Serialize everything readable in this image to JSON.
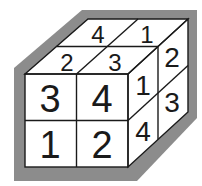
{
  "diagram": {
    "type": "2x2x2-cube-isometric",
    "colors": {
      "border": "#8c8c8c",
      "face": "#ffffff",
      "line": "#1a1a1a"
    },
    "faces": {
      "front": {
        "cells": [
          {
            "pos": "top-left",
            "value": "3"
          },
          {
            "pos": "top-right",
            "value": "4"
          },
          {
            "pos": "bottom-left",
            "value": "1"
          },
          {
            "pos": "bottom-right",
            "value": "2"
          }
        ]
      },
      "top": {
        "cells": [
          {
            "pos": "back-left",
            "value": "4"
          },
          {
            "pos": "back-right",
            "value": "1"
          },
          {
            "pos": "front-left",
            "value": "2"
          },
          {
            "pos": "front-right",
            "value": "3"
          }
        ]
      },
      "right": {
        "cells": [
          {
            "pos": "top-front",
            "value": "1"
          },
          {
            "pos": "top-back",
            "value": "2"
          },
          {
            "pos": "bottom-front",
            "value": "4"
          },
          {
            "pos": "bottom-back",
            "value": "3"
          }
        ]
      }
    }
  }
}
